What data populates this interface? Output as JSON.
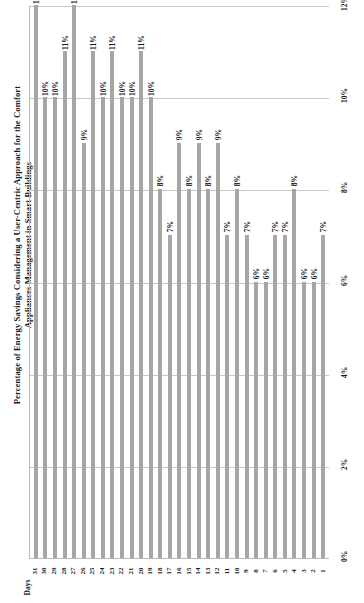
{
  "chart_data": {
    "type": "bar",
    "title": "Percentage of Energy Savings Considering a User-Centric Approach for the Comfort Appliances Management in Smart Buildings",
    "xlabel": "Days",
    "ylabel": "",
    "orientation": "vertical-rotated",
    "grid": true,
    "legend": "none",
    "ylim": [
      0,
      12
    ],
    "ytick_labels": [
      "0%",
      "2%",
      "4%",
      "6%",
      "8%",
      "10%",
      "12%"
    ],
    "ytick_values": [
      0,
      2,
      4,
      6,
      8,
      10,
      12
    ],
    "categories": [
      "31",
      "30",
      "29",
      "28",
      "27",
      "26",
      "25",
      "24",
      "23",
      "22",
      "21",
      "20",
      "19",
      "18",
      "17",
      "16",
      "15",
      "14",
      "13",
      "12",
      "11",
      "10",
      "9",
      "8",
      "7",
      "6",
      "5",
      "4",
      "3",
      "2",
      "1"
    ],
    "values": [
      12,
      10,
      10,
      11,
      12,
      9,
      11,
      10,
      11,
      10,
      10,
      11,
      10,
      8,
      7,
      9,
      8,
      9,
      8,
      9,
      7,
      8,
      7,
      6,
      6,
      7,
      7,
      8,
      6,
      6,
      7
    ],
    "value_labels": [
      "12%",
      "10%",
      "10%",
      "11%",
      "12%",
      "9%",
      "11%",
      "10%",
      "11%",
      "10%",
      "10%",
      "11%",
      "10%",
      "8%",
      "7%",
      "9%",
      "8%",
      "9%",
      "8%",
      "9%",
      "7%",
      "8%",
      "7%",
      "6%",
      "6%",
      "7%",
      "7%",
      "8%",
      "6%",
      "6%",
      "7%"
    ],
    "bar_color": "#a6a6a6",
    "grid_color": "#c8c8c8"
  }
}
